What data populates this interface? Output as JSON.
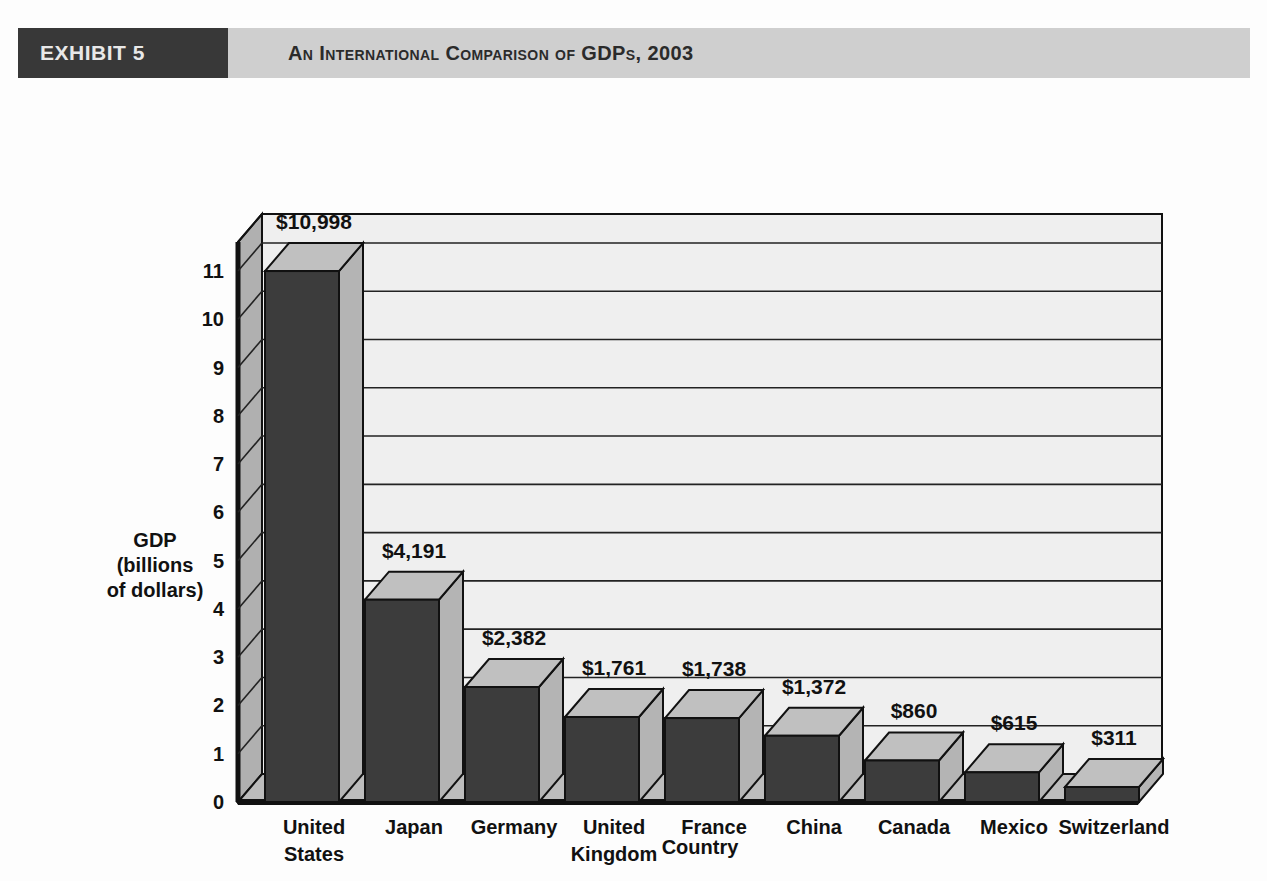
{
  "header": {
    "badge": "EXHIBIT 5",
    "title": "An International Comparison of GDPs, 2003"
  },
  "chart_data": {
    "type": "bar",
    "title": "An International Comparison of GDPs, 2003",
    "xlabel": "Country",
    "ylabel": "GDP (billions of dollars)",
    "ylabel_lines": [
      "GDP",
      "(billions",
      "of dollars)"
    ],
    "ylim": [
      0,
      11.6
    ],
    "yticks": [
      "0",
      "1",
      "2",
      "3",
      "4",
      "5",
      "6",
      "7",
      "8",
      "9",
      "10",
      "11"
    ],
    "ytick_values": [
      0,
      1,
      2,
      3,
      4,
      5,
      6,
      7,
      8,
      9,
      10,
      11
    ],
    "y_unit_note": "thousands of billions of dollars (trillions)",
    "grid": true,
    "legend": "none",
    "style": "3d-column",
    "categories": [
      "United States",
      "Japan",
      "Germany",
      "United Kingdom",
      "France",
      "China",
      "Canada",
      "Mexico",
      "Switzerland"
    ],
    "category_lines": [
      [
        "United",
        "States"
      ],
      [
        "Japan"
      ],
      [
        "Germany"
      ],
      [
        "United",
        "Kingdom"
      ],
      [
        "France"
      ],
      [
        "China"
      ],
      [
        "Canada"
      ],
      [
        "Mexico"
      ],
      [
        "Switzerland"
      ]
    ],
    "values": [
      10998,
      4191,
      2382,
      1761,
      1738,
      1372,
      860,
      615,
      311
    ],
    "values_plotted": [
      10.998,
      4.191,
      2.382,
      1.761,
      1.738,
      1.372,
      0.86,
      0.615,
      0.311
    ],
    "data_labels": [
      "$10,998",
      "$4,191",
      "$2,382",
      "$1,761",
      "$1,738",
      "$1,372",
      "$860",
      "$615",
      "$311"
    ]
  },
  "colors": {
    "badge_bg": "#383838",
    "badge_text": "#e8e8e8",
    "titlebar_bg": "#cfcfcf",
    "title_text": "#2b2b2b",
    "bar_front": "#3c3c3c",
    "bar_side": "#b4b4b4",
    "bar_top": "#c0c0c0",
    "plot_bg": "#efefef",
    "wall_side": "#b0b0b0",
    "floor": "#bcbcbc",
    "page_bg": "#fdfdfd",
    "axis_line": "#111111",
    "grid_line": "#222222"
  }
}
